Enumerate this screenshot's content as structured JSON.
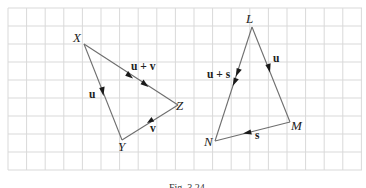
{
  "figure": {
    "caption": "Fig. 3.24",
    "grid": {
      "x0": 8,
      "y0": 8,
      "x1": 362,
      "y1": 170,
      "cell": 18.6,
      "color": "#d9d9d9"
    },
    "triangles": [
      {
        "name": "XYZ",
        "vertices": {
          "X": {
            "label": "X",
            "x": 84,
            "y": 44
          },
          "Y": {
            "label": "Y",
            "x": 122,
            "y": 140
          },
          "Z": {
            "label": "Z",
            "x": 178,
            "y": 105
          }
        },
        "edges": [
          {
            "from": "X",
            "to": "Y",
            "vector": "u"
          },
          {
            "from": "Y",
            "to": "Z",
            "vector": "v"
          },
          {
            "from": "X",
            "to": "Z",
            "vector": "u + v"
          }
        ]
      },
      {
        "name": "LMN",
        "vertices": {
          "L": {
            "label": "L",
            "x": 252,
            "y": 27
          },
          "M": {
            "label": "M",
            "x": 290,
            "y": 122
          },
          "N": {
            "label": "N",
            "x": 215,
            "y": 141
          }
        },
        "edges": [
          {
            "from": "L",
            "to": "M",
            "vector": "u"
          },
          {
            "from": "M",
            "to": "N",
            "vector": "s"
          },
          {
            "from": "L",
            "to": "N",
            "vector": "u + s"
          }
        ]
      }
    ],
    "labels": {
      "X": "X",
      "Y": "Y",
      "Z": "Z",
      "L": "L",
      "M": "M",
      "N": "N",
      "u_xy": "u",
      "v_yz": "v",
      "uv_xz": "u + v",
      "u_lm": "u",
      "s_mn": "s",
      "us_ln": "u + s"
    }
  }
}
